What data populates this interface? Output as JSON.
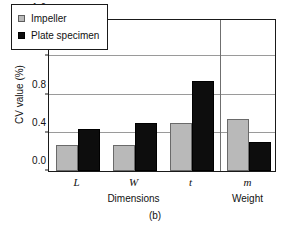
{
  "chart_data": {
    "type": "bar",
    "title": "",
    "caption": "(b)",
    "xlabel": "",
    "ylabel": "CV value (%)",
    "categories": [
      "L",
      "W",
      "t",
      "m"
    ],
    "group_labels": [
      {
        "label": "Dimensions",
        "categories": [
          "L",
          "W",
          "t"
        ]
      },
      {
        "label": "Weight",
        "categories": [
          "m"
        ]
      }
    ],
    "series": [
      {
        "name": "Impeller",
        "color": "#b9b9b9",
        "values": [
          0.27,
          0.27,
          0.5,
          0.54
        ]
      },
      {
        "name": "Plate specimen",
        "color": "#0d0d0d",
        "values": [
          0.44,
          0.5,
          0.94,
          0.3
        ]
      }
    ],
    "ylim": [
      0.0,
      1.6
    ],
    "yticks": [
      "0.0",
      "0.4",
      "0.8",
      "1.2",
      "1.6"
    ],
    "ytick_values": [
      0.0,
      0.4,
      0.8,
      1.2,
      1.6
    ],
    "grid": "horizontal",
    "legend_position": "top-left",
    "group_divider_after": "t"
  },
  "legend": {
    "items": [
      {
        "label": "Impeller",
        "swatch": "gray-square"
      },
      {
        "label": "Plate specimen",
        "swatch": "black-square"
      }
    ]
  }
}
